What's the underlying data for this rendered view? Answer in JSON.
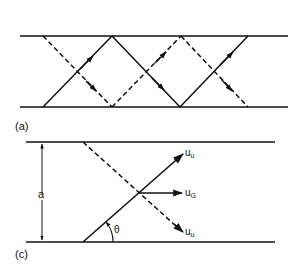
{
  "figure_a": {
    "label": "(a)",
    "description": "Two rays zig-zagging between parallel plates (solid and dashed)"
  },
  "figure_c": {
    "label": "(c)",
    "separation_label": "a",
    "angle_label": "θ",
    "vectors": [
      {
        "base": "u",
        "sub": "u",
        "position": "upper"
      },
      {
        "base": "u",
        "sub": "G",
        "position": "middle"
      },
      {
        "base": "u",
        "sub": "u",
        "position": "lower"
      }
    ]
  },
  "colors": {
    "line": "#111111",
    "background": "#ffffff"
  }
}
